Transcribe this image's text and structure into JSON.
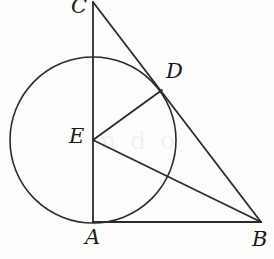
{
  "figure": {
    "kind": "geometry-diagram",
    "stroke_color": "#2b2b2b",
    "background_color": "#fdfdfc",
    "width": 274,
    "height": 259,
    "stroke_width": 1.6
  },
  "points": [
    {
      "id": "C",
      "label": "C",
      "x": 93,
      "y": 2,
      "label_x": 71,
      "label_y": -4
    },
    {
      "id": "D",
      "label": "D",
      "x": 162,
      "y": 90,
      "label_x": 166,
      "label_y": 61
    },
    {
      "id": "E",
      "label": "E",
      "x": 93,
      "y": 140,
      "label_x": 69,
      "label_y": 126
    },
    {
      "id": "A",
      "label": "A",
      "x": 93,
      "y": 222,
      "label_x": 85,
      "label_y": 227
    },
    {
      "id": "B",
      "label": "B",
      "x": 261,
      "y": 222,
      "label_x": 252,
      "label_y": 229
    }
  ],
  "circle": {
    "id": "circle-E",
    "center_label": "E",
    "cx": 93,
    "cy": 140,
    "r": 83
  },
  "segments": [
    {
      "id": "CA",
      "from": "C",
      "to": "A",
      "x1": 93,
      "y1": 2,
      "x2": 93,
      "y2": 222
    },
    {
      "id": "CB",
      "from": "C",
      "to": "B",
      "x1": 93,
      "y1": 2,
      "x2": 261,
      "y2": 222
    },
    {
      "id": "AB",
      "from": "A",
      "to": "B",
      "x1": 93,
      "y1": 222,
      "x2": 261,
      "y2": 222
    },
    {
      "id": "ED",
      "from": "E",
      "to": "D",
      "x1": 93,
      "y1": 140,
      "x2": 162,
      "y2": 90
    },
    {
      "id": "EB",
      "from": "E",
      "to": "B",
      "x1": 93,
      "y1": 140,
      "x2": 261,
      "y2": 222
    }
  ],
  "watermark": {
    "text": "n d o",
    "x": 100,
    "y": 126
  }
}
